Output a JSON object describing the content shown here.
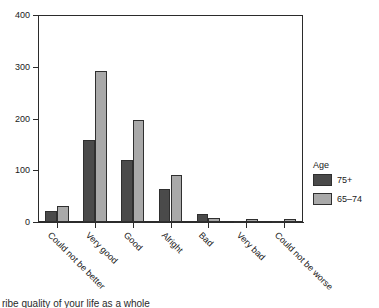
{
  "chart_data": {
    "type": "bar",
    "title": "",
    "subtitle": "",
    "xlabel": "",
    "ylabel": "",
    "ylim": [
      0,
      400
    ],
    "yticks": [
      0,
      100,
      200,
      300,
      400
    ],
    "ytick_labels": [
      "0",
      "100",
      "200",
      "300",
      "400"
    ],
    "grid": false,
    "legend_position": "right",
    "legend_title": "Age",
    "categories": [
      "Could not be better",
      "Very good",
      "Good",
      "Alright",
      "Bad",
      "Very bad",
      "Could not be worse"
    ],
    "series": [
      {
        "name": "75+",
        "color": "#4a4a4a",
        "values": [
          22,
          159,
          120,
          63,
          15,
          2,
          1
        ]
      },
      {
        "name": "65–74",
        "color": "#a9a9a9",
        "values": [
          30,
          292,
          198,
          91,
          8,
          5,
          5
        ]
      }
    ],
    "annotations": []
  },
  "legend": {
    "title": "Age",
    "entries": [
      {
        "label": "75+",
        "color": "#4a4a4a"
      },
      {
        "label": "65–74",
        "color": "#a9a9a9"
      }
    ]
  },
  "caption": {
    "clipped_text": "ribe quality of your life as a whole"
  }
}
